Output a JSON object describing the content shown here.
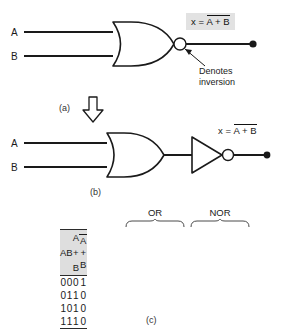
{
  "figure": {
    "title_parts": [
      "(a)",
      "(b)",
      "(c)"
    ]
  },
  "diagram_a": {
    "name": "nor-gate-symbol",
    "inputs": [
      {
        "label": "A"
      },
      {
        "label": "B"
      }
    ],
    "output_formula": {
      "prefix": "x = ",
      "overlined": "A + B"
    },
    "annotation": {
      "line1": "Denotes",
      "line2": "inversion"
    },
    "caption": "(a)"
  },
  "transition": {
    "arrow_icon": "down-arrow-icon"
  },
  "diagram_b": {
    "name": "or-gate-plus-inverter",
    "inputs": [
      {
        "label": "A"
      },
      {
        "label": "B"
      }
    ],
    "output_formula": {
      "prefix": "x = ",
      "overlined": "A + B"
    },
    "caption": "(b)"
  },
  "truth_table": {
    "caption": "(c)",
    "group_labels": [
      {
        "label": "OR"
      },
      {
        "label": "NOR"
      }
    ],
    "headers": {
      "a": "A",
      "b": "B",
      "or": "A + B",
      "nor": "A + B"
    },
    "rows": [
      {
        "a": "0",
        "b": "0",
        "or": "0",
        "nor": "1"
      },
      {
        "a": "0",
        "b": "1",
        "or": "1",
        "nor": "0"
      },
      {
        "a": "1",
        "b": "0",
        "or": "1",
        "nor": "0"
      },
      {
        "a": "1",
        "b": "1",
        "or": "1",
        "nor": "0"
      }
    ]
  },
  "colors": {
    "ink": "#1a1a1a",
    "formula_bg": "#e2e2e2",
    "header_bg": "#dedede",
    "separator_bg": "#c9c9c9"
  }
}
